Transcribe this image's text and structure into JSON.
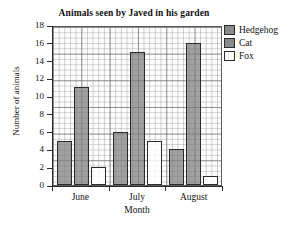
{
  "chart_data": {
    "type": "bar",
    "title": "Animals seen by Javed in his garden",
    "xlabel": "Month",
    "ylabel": "Number of animals",
    "categories": [
      "June",
      "July",
      "August"
    ],
    "series": [
      {
        "name": "Hedgehog",
        "color": "#8a8a8a",
        "values": [
          5,
          6,
          4
        ]
      },
      {
        "name": "Cat",
        "color": "#8a8a8a",
        "values": [
          11,
          15,
          16
        ]
      },
      {
        "name": "Fox",
        "color": "#ffffff",
        "values": [
          2,
          5,
          1
        ]
      }
    ],
    "ylim": [
      0,
      18
    ],
    "yticks": [
      0,
      2,
      4,
      6,
      8,
      10,
      12,
      14,
      16,
      18
    ],
    "ytick_labels": [
      "0",
      "2",
      "4",
      "6",
      "8",
      "10",
      "12",
      "14",
      "16",
      "18"
    ],
    "grid": true,
    "grid_style": "graph-paper-minor-and-major",
    "legend_position": "right",
    "legend_entries": [
      "Hedgehog",
      "Cat",
      "Fox"
    ]
  }
}
